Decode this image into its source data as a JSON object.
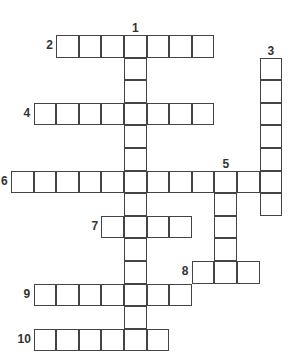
{
  "puzzle": {
    "cell_size": 22.6,
    "origin_x": 11,
    "origin_y": 35,
    "entries": [
      {
        "number": "1",
        "direction": "down",
        "col": 5,
        "row": 0,
        "length": 14
      },
      {
        "number": "2",
        "direction": "across",
        "col": 2,
        "row": 0,
        "length": 7
      },
      {
        "number": "3",
        "direction": "down",
        "col": 11,
        "row": 1,
        "length": 7
      },
      {
        "number": "4",
        "direction": "across",
        "col": 1,
        "row": 3,
        "length": 8
      },
      {
        "number": "5",
        "direction": "down",
        "col": 9,
        "row": 6,
        "length": 5
      },
      {
        "number": "6",
        "direction": "across",
        "col": 0,
        "row": 6,
        "length": 12
      },
      {
        "number": "7",
        "direction": "across",
        "col": 4,
        "row": 8,
        "length": 4
      },
      {
        "number": "8",
        "direction": "across",
        "col": 8,
        "row": 10,
        "length": 3
      },
      {
        "number": "9",
        "direction": "across",
        "col": 1,
        "row": 11,
        "length": 7
      },
      {
        "number": "10",
        "direction": "across",
        "col": 1,
        "row": 13,
        "length": 6
      }
    ]
  }
}
